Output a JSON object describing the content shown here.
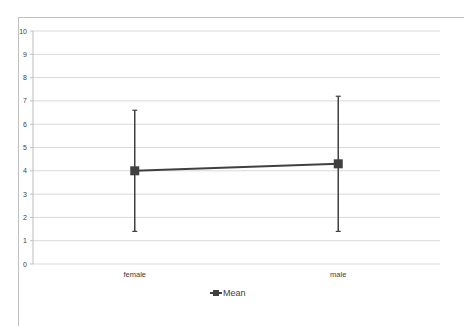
{
  "chart_data": {
    "type": "line",
    "title": "",
    "xlabel": "",
    "ylabel": "",
    "categories": [
      "female",
      "male"
    ],
    "series": [
      {
        "name": "Mean",
        "values": [
          4.0,
          4.3
        ],
        "error_upper": [
          6.6,
          7.2
        ],
        "error_lower": [
          1.4,
          1.4
        ],
        "color": "#404040",
        "marker": "square"
      }
    ],
    "ylim": [
      0,
      10
    ],
    "yticks": [
      0,
      1,
      2,
      3,
      4,
      5,
      6,
      7,
      8,
      9,
      10
    ],
    "grid": true,
    "legend_position": "bottom"
  },
  "legend": {
    "label": "Mean"
  },
  "colors": {
    "gridline": "#d9d9d9",
    "axis": "#bfbfbf",
    "series": "#404040"
  }
}
